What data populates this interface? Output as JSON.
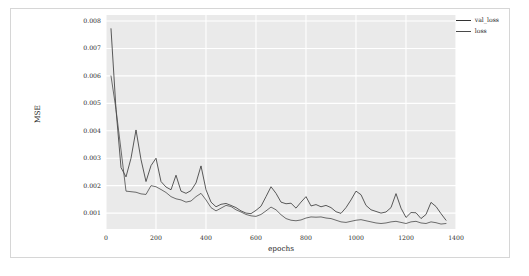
{
  "figure": {
    "background": "#ffffff",
    "plot_background": "#eaeaea",
    "grid_color": "#ffffff",
    "frame_color": "#d6d6d6"
  },
  "legend": {
    "position": "top-right",
    "entries": [
      {
        "label": "val_loss",
        "color": "#333333"
      },
      {
        "label": "loss",
        "color": "#4a4a4a"
      }
    ]
  },
  "chart_data": {
    "type": "line",
    "title": "",
    "xlabel": "epochs",
    "ylabel": "MSE",
    "xlim": [
      0,
      1400
    ],
    "ylim": [
      0.00042,
      0.00822
    ],
    "xticks": [
      0,
      200,
      400,
      600,
      800,
      1000,
      1200,
      1400
    ],
    "xtick_labels": [
      "0",
      "200",
      "400",
      "600",
      "800",
      "1000",
      "1200",
      "1400"
    ],
    "yticks": [
      0.001,
      0.002,
      0.003,
      0.004,
      0.005,
      0.006,
      0.007,
      0.008
    ],
    "ytick_labels": [
      "0.001",
      "0.002",
      "0.003",
      "0.004",
      "0.005",
      "0.006",
      "0.007",
      "0.008"
    ],
    "grid": true,
    "legend_position": "upper right",
    "series": [
      {
        "name": "val_loss",
        "color": "#333333",
        "x": [
          20,
          40,
          60,
          80,
          100,
          120,
          140,
          160,
          180,
          200,
          220,
          240,
          260,
          280,
          300,
          320,
          340,
          360,
          380,
          400,
          420,
          440,
          460,
          480,
          500,
          520,
          540,
          560,
          580,
          600,
          620,
          640,
          660,
          680,
          700,
          720,
          740,
          760,
          780,
          800,
          820,
          840,
          860,
          880,
          900,
          920,
          940,
          960,
          980,
          1000,
          1020,
          1040,
          1060,
          1080,
          1100,
          1120,
          1140,
          1160,
          1180,
          1200,
          1220,
          1240,
          1260,
          1280,
          1300,
          1320,
          1340,
          1360
        ],
        "y": [
          0.00772,
          0.00478,
          0.00266,
          0.00232,
          0.003,
          0.00403,
          0.00295,
          0.00215,
          0.00273,
          0.003,
          0.00215,
          0.00195,
          0.00185,
          0.00238,
          0.0018,
          0.00172,
          0.00182,
          0.0021,
          0.00272,
          0.00185,
          0.0014,
          0.00123,
          0.00132,
          0.00135,
          0.00128,
          0.0012,
          0.00108,
          0.001,
          0.00098,
          0.0011,
          0.00125,
          0.0016,
          0.00196,
          0.00172,
          0.0014,
          0.00134,
          0.00136,
          0.00118,
          0.0014,
          0.0016,
          0.00126,
          0.00131,
          0.00123,
          0.00128,
          0.0012,
          0.00105,
          0.00099,
          0.0012,
          0.00148,
          0.0018,
          0.00167,
          0.00128,
          0.00112,
          0.00106,
          0.001,
          0.00104,
          0.0012,
          0.00171,
          0.00118,
          0.00084,
          0.00102,
          0.00101,
          0.0008,
          0.00095,
          0.00139,
          0.00124,
          0.00098,
          0.00074
        ]
      },
      {
        "name": "loss",
        "color": "#4a4a4a",
        "x": [
          20,
          40,
          60,
          80,
          100,
          120,
          140,
          160,
          180,
          200,
          220,
          240,
          260,
          280,
          300,
          320,
          340,
          360,
          380,
          400,
          420,
          440,
          460,
          480,
          500,
          520,
          540,
          560,
          580,
          600,
          620,
          640,
          660,
          680,
          700,
          720,
          740,
          760,
          780,
          800,
          820,
          840,
          860,
          880,
          900,
          920,
          940,
          960,
          980,
          1000,
          1020,
          1040,
          1060,
          1080,
          1100,
          1120,
          1140,
          1160,
          1180,
          1200,
          1220,
          1240,
          1260,
          1280,
          1300,
          1320,
          1340,
          1360
        ],
        "y": [
          0.006,
          0.00478,
          0.0033,
          0.0018,
          0.00178,
          0.00176,
          0.0017,
          0.00168,
          0.002,
          0.00196,
          0.00186,
          0.00175,
          0.0016,
          0.00152,
          0.00148,
          0.0014,
          0.00144,
          0.0016,
          0.00172,
          0.00148,
          0.0012,
          0.00108,
          0.00118,
          0.00128,
          0.00124,
          0.00112,
          0.00104,
          0.00095,
          0.0009,
          0.00088,
          0.00095,
          0.00108,
          0.00122,
          0.00112,
          0.00094,
          0.0008,
          0.00074,
          0.00072,
          0.00075,
          0.00082,
          0.00086,
          0.00085,
          0.00086,
          0.00082,
          0.0008,
          0.00074,
          0.00068,
          0.00066,
          0.0007,
          0.00074,
          0.00076,
          0.00072,
          0.00068,
          0.00064,
          0.00062,
          0.00064,
          0.00068,
          0.0007,
          0.00066,
          0.00062,
          0.00068,
          0.0007,
          0.00064,
          0.00062,
          0.00068,
          0.00065,
          0.0006,
          0.00062
        ]
      }
    ]
  }
}
